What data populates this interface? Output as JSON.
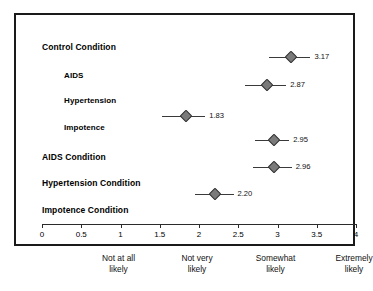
{
  "chart_data": {
    "type": "scatter",
    "title": "",
    "xlabel": "",
    "ylabel": "",
    "xlim": [
      0,
      4
    ],
    "grid": false,
    "legend": null,
    "orientation": "horizontal",
    "marker": "diamond",
    "marker_color": "#7a7a7a",
    "marker_edge_color": "#2e2e2e",
    "errorbar_color": "#3a3a3a",
    "axis_color": "#2b2b2b",
    "frame_color": "#1a1a1a",
    "xticks": [
      0,
      0.5,
      1,
      1.5,
      2,
      2.5,
      3,
      3.5,
      4
    ],
    "xtick_labels": [
      "0",
      "0.5",
      "1",
      "1.5",
      "2",
      "2.5",
      "3",
      "3.5",
      "4"
    ],
    "scale_anchors": [
      {
        "value": 1,
        "line1": "Not at all",
        "line2": "likely"
      },
      {
        "value": 2,
        "line1": "Not very",
        "line2": "likely"
      },
      {
        "value": 3,
        "line1": "Somewhat",
        "line2": "likely"
      },
      {
        "value": 4,
        "line1": "Extremely",
        "line2": "likely"
      }
    ],
    "categories": [
      "Control Condition",
      "AIDS",
      "Hypertension",
      "Impotence",
      "AIDS Condition",
      "Hypertension Condition",
      "Impotence Condition"
    ],
    "values": [
      null,
      3.17,
      2.87,
      1.83,
      2.95,
      2.96,
      2.2
    ],
    "rows": [
      {
        "label": "Control Condition",
        "indent": false,
        "has_point": false,
        "value": null,
        "value_text": "",
        "ci_low": null,
        "ci_high": null,
        "label_y": 27,
        "point_y": 0
      },
      {
        "label": "AIDS",
        "indent": true,
        "has_point": true,
        "value": 3.17,
        "value_text": "3.17",
        "ci_low": 2.89,
        "ci_high": 3.42,
        "label_y": 56,
        "point_y": 42
      },
      {
        "label": "Hypertension",
        "indent": true,
        "has_point": true,
        "value": 2.87,
        "value_text": "2.87",
        "ci_low": 2.58,
        "ci_high": 3.11,
        "label_y": 81,
        "point_y": 70
      },
      {
        "label": "Impotence",
        "indent": true,
        "has_point": true,
        "value": 1.83,
        "value_text": "1.83",
        "ci_low": 1.53,
        "ci_high": 2.08,
        "label_y": 108,
        "point_y": 101
      },
      {
        "label": "AIDS Condition",
        "indent": false,
        "has_point": true,
        "value": 2.95,
        "value_text": "2.95",
        "ci_low": 2.71,
        "ci_high": 3.15,
        "label_y": 137,
        "point_y": 125
      },
      {
        "label": "Hypertension Condition",
        "indent": false,
        "has_point": true,
        "value": 2.96,
        "value_text": "2.96",
        "ci_low": 2.69,
        "ci_high": 3.18,
        "label_y": 163,
        "point_y": 152
      },
      {
        "label": "Impotence Condition",
        "indent": false,
        "has_point": true,
        "value": 2.2,
        "value_text": "2.20",
        "ci_low": 1.95,
        "ci_high": 2.44,
        "label_y": 190,
        "point_y": 179
      }
    ]
  }
}
